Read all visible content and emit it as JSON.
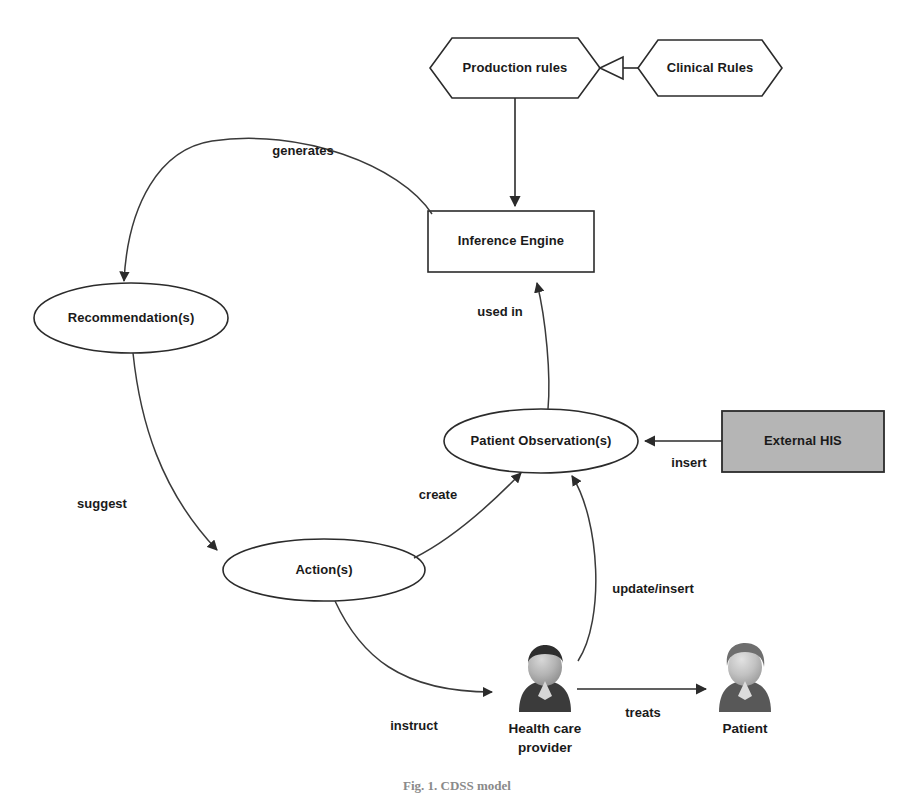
{
  "figure": {
    "caption": "Fig. 1.  CDSS model",
    "background_color": "#ffffff",
    "line_color": "#2b2b2b"
  },
  "nodes": {
    "production_rules": {
      "label": "Production rules",
      "shape": "hexagon"
    },
    "clinical_rules": {
      "label": "Clinical Rules",
      "shape": "hexagon"
    },
    "inference_engine": {
      "label": "Inference Engine",
      "shape": "rectangle"
    },
    "recommendations": {
      "label": "Recommendation(s)",
      "shape": "ellipse"
    },
    "actions": {
      "label": "Action(s)",
      "shape": "ellipse"
    },
    "patient_observations": {
      "label": "Patient Observation(s)",
      "shape": "ellipse"
    },
    "external_his": {
      "label": "External HIS",
      "shape": "rectangle",
      "fill_color": "#b5b5b5"
    }
  },
  "actors": {
    "health_care_provider": {
      "label_line1": "Health care",
      "label_line2": "provider",
      "color": "#3b3b3b"
    },
    "patient": {
      "label_line1": "Patient",
      "label_line2": "",
      "color": "#6e6e6e"
    }
  },
  "edges": {
    "generates": {
      "label": "generates",
      "from": "inference_engine",
      "to": "recommendations"
    },
    "used_in": {
      "label": "used in",
      "from": "patient_observations",
      "to": "inference_engine"
    },
    "suggest": {
      "label": "suggest",
      "from": "recommendations",
      "to": "actions"
    },
    "create": {
      "label": "create",
      "from": "actions",
      "to": "patient_observations"
    },
    "insert": {
      "label": "insert",
      "from": "external_his",
      "to": "patient_observations"
    },
    "update_insert": {
      "label": "update/insert",
      "from": "health_care_provider",
      "to": "patient_observations"
    },
    "instruct": {
      "label": "instruct",
      "from": "actions",
      "to": "health_care_provider"
    },
    "treats": {
      "label": "treats",
      "from": "health_care_provider",
      "to": "patient"
    },
    "generalization": {
      "label": "",
      "from": "clinical_rules",
      "to": "production_rules"
    },
    "rules_to_engine": {
      "label": "",
      "from": "production_rules",
      "to": "inference_engine"
    }
  }
}
